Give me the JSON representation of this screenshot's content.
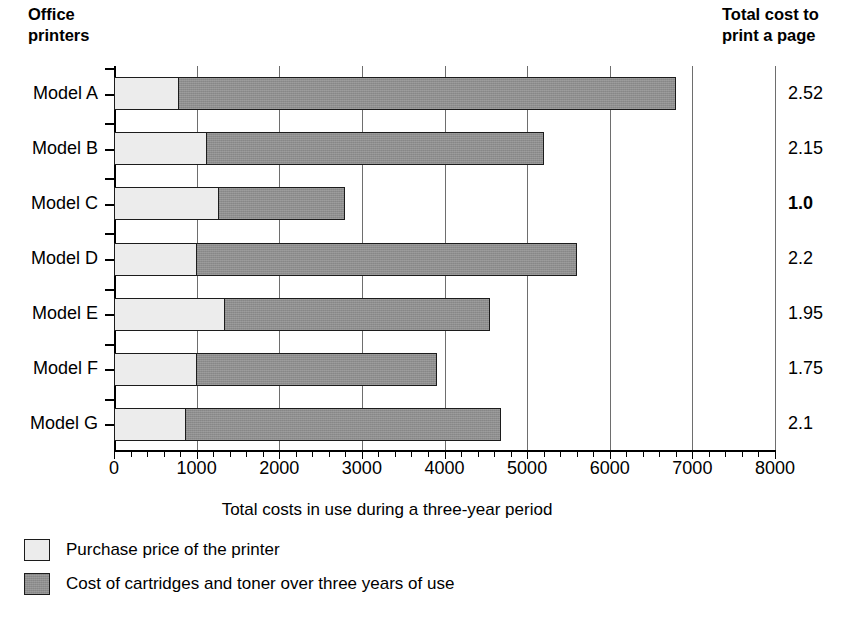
{
  "header": {
    "left_title_line1": "Office",
    "left_title_line2": "printers",
    "right_title_line1": "Total cost to",
    "right_title_line2": "print a page"
  },
  "chart_data": {
    "type": "bar",
    "orientation": "horizontal",
    "stacked": true,
    "title": "",
    "xlabel": "Total costs in use during a three-year period",
    "ylabel": "Office printers",
    "xlim": [
      0,
      8000
    ],
    "xticks": [
      0,
      1000,
      2000,
      3000,
      4000,
      5000,
      6000,
      7000,
      8000
    ],
    "xticklabels": [
      "0",
      "1000",
      "2000",
      "3000",
      "4000",
      "5000",
      "6000",
      "7000",
      "8000"
    ],
    "minor_tick_step": 200,
    "grid": true,
    "legend_position": "below",
    "categories": [
      "Model A",
      "Model B",
      "Model C",
      "Model D",
      "Model E",
      "Model F",
      "Model G"
    ],
    "series": [
      {
        "name": "Purchase price of the printer",
        "color": "#ececec",
        "values": [
          760,
          1100,
          1250,
          980,
          1320,
          980,
          850
        ]
      },
      {
        "name": "Cost of cartridges and toner over three years of use",
        "color": "#8e8e8e",
        "values": [
          6040,
          4100,
          1550,
          4620,
          3230,
          2930,
          3830
        ]
      }
    ],
    "totals": [
      6800,
      5200,
      2800,
      5600,
      4550,
      3910,
      4680
    ],
    "annotations": {
      "label": "Total cost to print a page",
      "values": [
        "2.52",
        "2.15",
        "1.0",
        "2.2",
        "1.95",
        "1.75",
        "2.1"
      ],
      "emphasis_index": 2
    }
  },
  "legend": [
    {
      "label": "Purchase price of the printer",
      "swatch": "light"
    },
    {
      "label": "Cost of cartridges and toner over three years of use",
      "swatch": "dark"
    }
  ]
}
